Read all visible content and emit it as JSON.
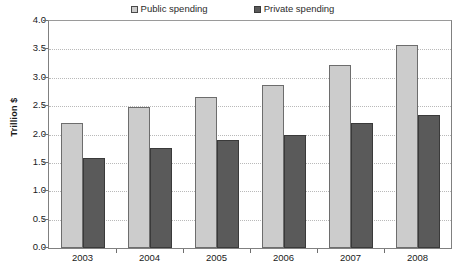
{
  "chart_data": {
    "type": "bar",
    "title": "",
    "xlabel": "",
    "ylabel": "Trillion $",
    "categories": [
      "2003",
      "2004",
      "2005",
      "2006",
      "2007",
      "2008"
    ],
    "series": [
      {
        "name": "Public spending",
        "color": "#cccccc",
        "values": [
          2.2,
          2.48,
          2.66,
          2.87,
          3.22,
          3.57
        ]
      },
      {
        "name": "Private spending",
        "color": "#5a5a5a",
        "values": [
          1.58,
          1.76,
          1.9,
          2.0,
          2.2,
          2.34
        ]
      }
    ],
    "ylim": [
      0.0,
      4.0
    ],
    "ytick_step": 0.5,
    "yticks": [
      "4.0",
      "3.5",
      "3.0",
      "2.5",
      "2.0",
      "1.5",
      "1.0",
      "0.5",
      "0.0"
    ],
    "grid": true,
    "grid_axis": "y",
    "legend_position": "top-center"
  },
  "legend": {
    "entries": [
      {
        "label": "Public spending",
        "marker": "legend-swatch-public",
        "color": "#cccccc"
      },
      {
        "label": "Private spending",
        "marker": "legend-swatch-private",
        "color": "#5a5a5a"
      }
    ]
  },
  "axes": {
    "y_title": "Trillion $"
  }
}
